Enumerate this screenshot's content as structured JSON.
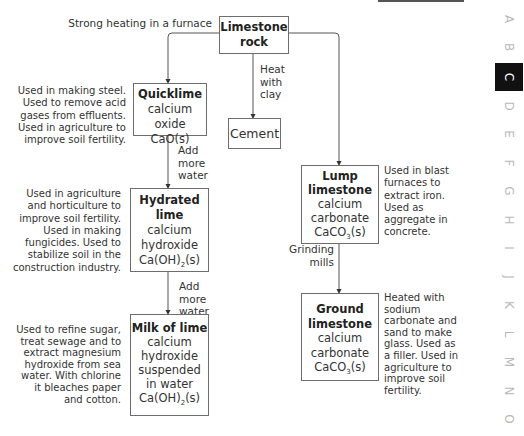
{
  "diagram": {
    "process_label": "Strong heating in a furnace",
    "nodes": {
      "limestone_rock": {
        "title_1": "Limestone",
        "title_2": "rock"
      },
      "quicklime": {
        "title": "Quicklime",
        "name": "calcium oxide",
        "formula": "CaO(s)"
      },
      "cement": {
        "title": "Cement"
      },
      "hydrated_lime": {
        "title_1": "Hydrated",
        "title_2": "lime",
        "name_1": "calcium",
        "name_2": "hydroxide",
        "formula_pre": "Ca(OH)",
        "formula_sub": "2",
        "formula_post": "(s)"
      },
      "milk_of_lime": {
        "title": "Milk of lime",
        "name_1": "calcium",
        "name_2": "hydroxide",
        "name_3": "suspended",
        "name_4": "in water",
        "formula_pre": "Ca(OH)",
        "formula_sub": "2",
        "formula_post": "(s)"
      },
      "lump_limestone": {
        "title_1": "Lump",
        "title_2": "limestone",
        "name_1": "calcium",
        "name_2": "carbonate",
        "formula_pre": "CaCO",
        "formula_sub": "3",
        "formula_post": "(s)"
      },
      "ground_limestone": {
        "title_1": "Ground",
        "title_2": "limestone",
        "name_1": "calcium",
        "name_2": "carbonate",
        "formula_pre": "CaCO",
        "formula_sub": "3",
        "formula_post": "(s)"
      }
    },
    "edge_labels": {
      "heat_with_clay": [
        "Heat",
        "with",
        "clay"
      ],
      "add_more_water_1": [
        "Add",
        "more",
        "water"
      ],
      "add_more_water_2": [
        "Add",
        "more",
        "water"
      ],
      "grinding_mills": [
        "Grinding",
        "mills"
      ]
    },
    "notes": {
      "quicklime": [
        "Used in making steel.",
        "Used to remove acid",
        "gases from effluents.",
        "Used in agriculture to",
        "improve soil fertility."
      ],
      "hydrated_lime": [
        "Used in agriculture",
        "and horticulture to",
        "improve soil fertility.",
        "Used in making",
        "fungicides. Used to",
        "stabilize soil in the",
        "construction industry."
      ],
      "milk_of_lime": [
        "Used to refine sugar,",
        "treat sewage and to",
        "extract magnesium",
        "hydroxide from sea",
        "water. With chlorine",
        "it bleaches paper",
        "and cotton."
      ],
      "lump_limestone": [
        "Used in blast",
        "furnaces to",
        "extract iron.",
        "Used as",
        "aggregate in",
        "concrete."
      ],
      "ground_limestone": [
        "Heated with",
        "sodium",
        "carbonate and",
        "sand to make",
        "glass. Used as",
        "a filler. Used in",
        "agriculture to",
        "improve soil",
        "fertility."
      ]
    }
  },
  "index_sidebar": {
    "letters": [
      "A",
      "B",
      "C",
      "D",
      "E",
      "F",
      "G",
      "H",
      "I",
      "J",
      "K",
      "L",
      "M",
      "N",
      "O"
    ],
    "active": "C",
    "active_color": "#111111"
  }
}
